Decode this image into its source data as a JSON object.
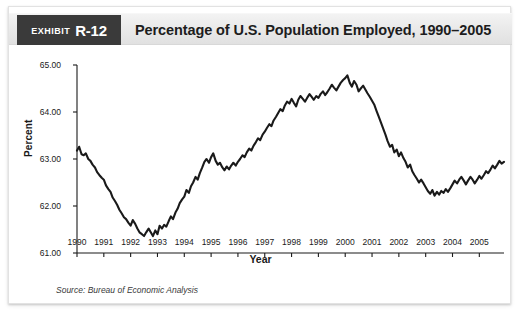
{
  "exhibit": {
    "badge_word": "Exhibit",
    "badge_number": "R-12",
    "title": "Percentage of U.S. Population Employed, 1990–2005",
    "source": "Source: Bureau of Economic Analysis"
  },
  "colors": {
    "badge_background": "#3a3a3a",
    "header_background": "#eaeaea",
    "line": "#1a1a1a",
    "axis": "#1a1a1a",
    "panel_background": "#ffffff",
    "text": "#1d1d1d"
  },
  "chart_data": {
    "type": "line",
    "title": "Percentage of U.S. Population Employed, 1990–2005",
    "xlabel": "Year",
    "ylabel": "Percent",
    "xlim": [
      1990,
      2005.92
    ],
    "ylim": [
      61.0,
      65.0
    ],
    "ytick_labels": [
      "65.00",
      "64.00",
      "63.00",
      "62.00",
      "61.00"
    ],
    "ytick_values": [
      65.0,
      64.0,
      63.0,
      62.0,
      61.0
    ],
    "xtick_labels": [
      "1990",
      "1991",
      "1992",
      "1993",
      "1994",
      "1995",
      "1996",
      "1997",
      "1998",
      "1999",
      "2000",
      "2001",
      "2002",
      "2003",
      "2004",
      "2005"
    ],
    "xtick_values": [
      1990,
      1991,
      1992,
      1993,
      1994,
      1995,
      1996,
      1997,
      1998,
      1999,
      2000,
      2001,
      2002,
      2003,
      2004,
      2005
    ],
    "grid": false,
    "legend": false,
    "series": [
      {
        "name": "Percentage of U.S. population employed",
        "x": [
          1990.0,
          1990.08,
          1990.17,
          1990.25,
          1990.33,
          1990.42,
          1990.5,
          1990.58,
          1990.67,
          1990.75,
          1990.83,
          1990.92,
          1991.0,
          1991.08,
          1991.17,
          1991.25,
          1991.33,
          1991.42,
          1991.5,
          1991.58,
          1991.67,
          1991.75,
          1991.83,
          1991.92,
          1992.0,
          1992.08,
          1992.17,
          1992.25,
          1992.33,
          1992.42,
          1992.5,
          1992.58,
          1992.67,
          1992.75,
          1992.83,
          1992.92,
          1993.0,
          1993.08,
          1993.17,
          1993.25,
          1993.33,
          1993.42,
          1993.5,
          1993.58,
          1993.67,
          1993.75,
          1993.83,
          1993.92,
          1994.0,
          1994.08,
          1994.17,
          1994.25,
          1994.33,
          1994.42,
          1994.5,
          1994.58,
          1994.67,
          1994.75,
          1994.83,
          1994.92,
          1995.0,
          1995.08,
          1995.17,
          1995.25,
          1995.33,
          1995.42,
          1995.5,
          1995.58,
          1995.67,
          1995.75,
          1995.83,
          1995.92,
          1996.0,
          1996.08,
          1996.17,
          1996.25,
          1996.33,
          1996.42,
          1996.5,
          1996.58,
          1996.67,
          1996.75,
          1996.83,
          1996.92,
          1997.0,
          1997.08,
          1997.17,
          1997.25,
          1997.33,
          1997.42,
          1997.5,
          1997.58,
          1997.67,
          1997.75,
          1997.83,
          1997.92,
          1998.0,
          1998.08,
          1998.17,
          1998.25,
          1998.33,
          1998.42,
          1998.5,
          1998.58,
          1998.67,
          1998.75,
          1998.83,
          1998.92,
          1999.0,
          1999.08,
          1999.17,
          1999.25,
          1999.33,
          1999.42,
          1999.5,
          1999.58,
          1999.67,
          1999.75,
          1999.83,
          1999.92,
          2000.0,
          2000.08,
          2000.17,
          2000.25,
          2000.33,
          2000.42,
          2000.5,
          2000.58,
          2000.67,
          2000.75,
          2000.83,
          2000.92,
          2001.0,
          2001.08,
          2001.17,
          2001.25,
          2001.33,
          2001.42,
          2001.5,
          2001.58,
          2001.67,
          2001.75,
          2001.83,
          2001.92,
          2002.0,
          2002.08,
          2002.17,
          2002.25,
          2002.33,
          2002.42,
          2002.5,
          2002.58,
          2002.67,
          2002.75,
          2002.83,
          2002.92,
          2003.0,
          2003.08,
          2003.17,
          2003.25,
          2003.33,
          2003.42,
          2003.5,
          2003.58,
          2003.67,
          2003.75,
          2003.83,
          2003.92,
          2004.0,
          2004.08,
          2004.17,
          2004.25,
          2004.33,
          2004.42,
          2004.5,
          2004.58,
          2004.67,
          2004.75,
          2004.83,
          2004.92,
          2005.0,
          2005.08,
          2005.17,
          2005.25,
          2005.33,
          2005.42,
          2005.5,
          2005.58,
          2005.67,
          2005.75,
          2005.83,
          2005.92
        ],
        "y": [
          63.18,
          63.26,
          63.1,
          63.08,
          63.12,
          63.0,
          62.96,
          62.88,
          62.82,
          62.72,
          62.66,
          62.6,
          62.56,
          62.44,
          62.36,
          62.3,
          62.18,
          62.1,
          62.02,
          61.92,
          61.84,
          61.76,
          61.72,
          61.64,
          61.58,
          61.7,
          61.62,
          61.52,
          61.44,
          61.4,
          61.36,
          61.44,
          61.52,
          61.44,
          61.36,
          61.48,
          61.4,
          61.58,
          61.52,
          61.6,
          61.56,
          61.68,
          61.78,
          61.72,
          61.86,
          61.94,
          62.06,
          62.14,
          62.2,
          62.34,
          62.28,
          62.42,
          62.5,
          62.62,
          62.56,
          62.7,
          62.82,
          62.94,
          63.0,
          62.92,
          63.04,
          63.12,
          62.96,
          62.88,
          62.92,
          62.82,
          62.76,
          62.84,
          62.78,
          62.86,
          62.92,
          62.86,
          62.94,
          63.0,
          63.08,
          63.04,
          63.14,
          63.22,
          63.18,
          63.28,
          63.36,
          63.44,
          63.4,
          63.52,
          63.58,
          63.66,
          63.74,
          63.7,
          63.82,
          63.9,
          63.98,
          64.06,
          64.02,
          64.14,
          64.22,
          64.18,
          64.28,
          64.2,
          64.12,
          64.26,
          64.34,
          64.28,
          64.22,
          64.3,
          64.38,
          64.32,
          64.26,
          64.34,
          64.3,
          64.38,
          64.44,
          64.36,
          64.42,
          64.5,
          64.58,
          64.52,
          64.46,
          64.54,
          64.62,
          64.68,
          64.72,
          64.78,
          64.62,
          64.54,
          64.66,
          64.58,
          64.44,
          64.5,
          64.56,
          64.48,
          64.4,
          64.32,
          64.24,
          64.16,
          64.02,
          63.9,
          63.78,
          63.64,
          63.52,
          63.38,
          63.26,
          63.3,
          63.14,
          63.2,
          63.06,
          63.14,
          63.02,
          62.94,
          62.82,
          62.88,
          62.74,
          62.66,
          62.58,
          62.5,
          62.56,
          62.48,
          62.4,
          62.32,
          62.26,
          62.34,
          62.22,
          62.3,
          62.24,
          62.32,
          62.28,
          62.36,
          62.3,
          62.38,
          62.46,
          62.54,
          62.48,
          62.56,
          62.62,
          62.54,
          62.46,
          62.54,
          62.62,
          62.56,
          62.48,
          62.56,
          62.64,
          62.58,
          62.66,
          62.74,
          62.7,
          62.78,
          62.86,
          62.8,
          62.88,
          62.96,
          62.9,
          62.94
        ]
      }
    ]
  }
}
